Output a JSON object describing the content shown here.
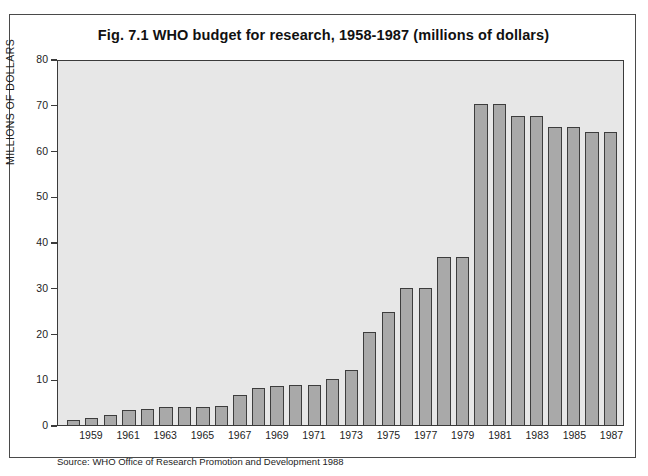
{
  "figure": {
    "title": "Fig. 7.1  WHO budget for research, 1958-1987 (millions of dollars)",
    "source": "Source: WHO Office of Research Promotion and Development 1988"
  },
  "colors": {
    "bar_fill": "#a9a9a9",
    "bar_outline": "#3d3d3d",
    "plot_background": "#e7e7e7",
    "frame": "#4a4a4a",
    "text": "#1d1d1d"
  },
  "chart_data": {
    "type": "bar",
    "title": "Fig. 7.1  WHO budget for research, 1958-1987 (millions of dollars)",
    "xlabel": "",
    "ylabel": "MILLIONS OF DOLLARS",
    "ylim": [
      0,
      80
    ],
    "yticks": [
      0,
      10,
      20,
      30,
      40,
      50,
      60,
      70,
      80
    ],
    "grid": false,
    "legend": null,
    "categories": [
      "1958",
      "1959",
      "1960",
      "1961",
      "1962",
      "1963",
      "1964",
      "1965",
      "1966",
      "1967",
      "1968",
      "1969",
      "1970",
      "1971",
      "1972",
      "1973",
      "1974",
      "1975",
      "1976",
      "1977",
      "1978",
      "1979",
      "1980",
      "1981",
      "1982",
      "1983",
      "1984",
      "1985",
      "1986",
      "1987"
    ],
    "values": [
      1.0,
      1.5,
      2.1,
      3.2,
      3.6,
      3.9,
      3.9,
      4.0,
      4.2,
      6.5,
      8.1,
      8.5,
      8.7,
      8.9,
      10.2,
      12.0,
      20.4,
      24.9,
      30.1,
      30.2,
      37.0,
      37.0,
      70.6,
      70.6,
      68.0,
      68.0,
      65.4,
      65.4,
      64.5,
      64.5
    ],
    "xtick_labels_shown": [
      "1959",
      "1961",
      "1963",
      "1965",
      "1967",
      "1969",
      "1971",
      "1973",
      "1975",
      "1977",
      "1979",
      "1981",
      "1983",
      "1985",
      "1987"
    ]
  }
}
